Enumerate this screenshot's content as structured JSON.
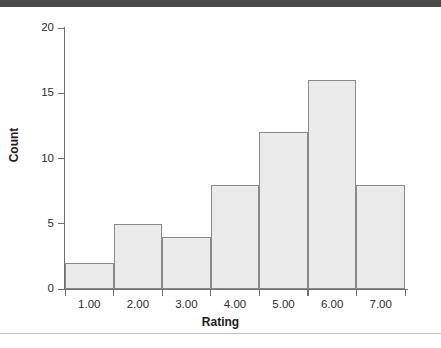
{
  "chart_data": {
    "type": "bar",
    "title": "",
    "subtitle": "",
    "xlabel": "Rating",
    "ylabel": "Count",
    "categories": [
      "1.00",
      "2.00",
      "3.00",
      "4.00",
      "5.00",
      "6.00",
      "7.00"
    ],
    "values": [
      2,
      5,
      4,
      8,
      12,
      16,
      8
    ],
    "x_tick_labels": [
      "1.00",
      "2.00",
      "3.00",
      "4.00",
      "5.00",
      "6.00",
      "7.00"
    ],
    "y_tick_labels": [
      "0",
      "5",
      "10",
      "15",
      "20"
    ],
    "y_tick_values": [
      0,
      5,
      10,
      15,
      20
    ],
    "ylim": [
      0,
      20
    ],
    "grid": false,
    "legend": null,
    "annotations": [],
    "bar_fill_color": "#ebebeb",
    "bar_border_color": "#8a8a8a",
    "axis_color": "#6e6e6e",
    "text_color": "#2b2b2b"
  },
  "chrome": {
    "top_band_color": "#4a4a4a",
    "bottom_rule_color": "#bfbfbf"
  }
}
